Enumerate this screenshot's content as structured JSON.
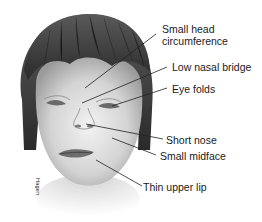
{
  "figure": {
    "type": "labeled illustration",
    "signature": "Hagen"
  },
  "labels": [
    {
      "line1": "Small head",
      "line2": "circumference"
    },
    {
      "text": "Low nasal bridge"
    },
    {
      "text": "Eye folds"
    },
    {
      "text": "Short nose"
    },
    {
      "text": "Small midface"
    },
    {
      "text": "Thin upper lip"
    }
  ],
  "colors": {
    "background": "#ffffff",
    "text": "#1a1a1a",
    "leader_line": "#222222",
    "hair": "#3a3a3a",
    "skin": "#d9d9d9"
  }
}
